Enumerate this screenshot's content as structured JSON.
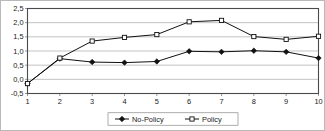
{
  "chart_data": {
    "type": "line",
    "title": "",
    "xlabel": "",
    "ylabel": "",
    "x": [
      1,
      2,
      3,
      4,
      5,
      6,
      7,
      8,
      9,
      10
    ],
    "categories": [
      "1",
      "2",
      "3",
      "4",
      "5",
      "6",
      "7",
      "8",
      "9",
      "10"
    ],
    "xtick_labels": [
      "1",
      "2",
      "3",
      "4",
      "5",
      "6",
      "7",
      "8",
      "9",
      "10"
    ],
    "ytick_labels": [
      "2,5",
      "2,0",
      "1,5",
      "1,0",
      "0,5",
      "0,0",
      "-0,5"
    ],
    "ytick_values": [
      2.5,
      2.0,
      1.5,
      1.0,
      0.5,
      0.0,
      -0.5
    ],
    "ylim": [
      -0.5,
      2.5
    ],
    "xlim": [
      1,
      10
    ],
    "grid": true,
    "grid_axis": "y",
    "legend_position": "bottom-center",
    "series": [
      {
        "name": "No-Policy",
        "marker": "filled-diamond",
        "values": [
          -0.15,
          0.73,
          0.61,
          0.59,
          0.63,
          0.99,
          0.97,
          1.01,
          0.97,
          0.75
        ]
      },
      {
        "name": "Policy",
        "marker": "hollow-square",
        "values": [
          -0.15,
          0.75,
          1.35,
          1.48,
          1.58,
          2.03,
          2.08,
          1.51,
          1.41,
          1.52
        ]
      }
    ]
  },
  "legend": {
    "entries": [
      {
        "label": "No-Policy"
      },
      {
        "label": "Policy"
      }
    ]
  },
  "colors": {
    "series_line": "#111111",
    "gridline": "#9a9a9a",
    "plot_border": "#4a4a4a",
    "background": "#ffffff",
    "text": "#1a1a1a"
  }
}
